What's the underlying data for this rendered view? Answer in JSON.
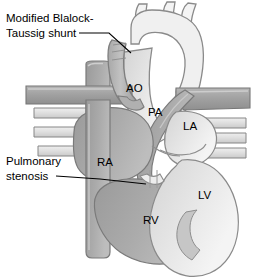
{
  "figure": {
    "background_color": "#ffffff"
  },
  "callouts": [
    {
      "id": "bt-shunt",
      "line1": "Modified Blalock-",
      "line2": "Taussig shunt",
      "full_text": "Modified Blalock-Taussig shunt"
    },
    {
      "id": "pulmonary-stenosis",
      "line1": "Pulmonary",
      "line2": "stenosis",
      "full_text": "Pulmonary stenosis"
    }
  ],
  "chamber_labels": [
    {
      "id": "ao",
      "text": "AO",
      "name": "aorta"
    },
    {
      "id": "pa",
      "text": "PA",
      "name": "pulmonary artery"
    },
    {
      "id": "la",
      "text": "LA",
      "name": "left atrium"
    },
    {
      "id": "ra",
      "text": "RA",
      "name": "right atrium"
    },
    {
      "id": "lv",
      "text": "LV",
      "name": "left ventricle"
    },
    {
      "id": "rv",
      "text": "RV",
      "name": "right ventricle"
    }
  ],
  "colors": {
    "background": "#ffffff",
    "outline": "#6e6e6e",
    "outline_dark": "#5a5a5a",
    "deoxygenated_dark": "#a0a0a0",
    "deoxygenated_mid": "#acacac",
    "oxygenated_light": "#e6e6e6",
    "lumen_pale": "#f2f2f2",
    "vessel_wall": "#d8d8d8",
    "shunt_graft": "#b4b4b4",
    "label_text": "#000000",
    "leader_line": "#000000"
  }
}
